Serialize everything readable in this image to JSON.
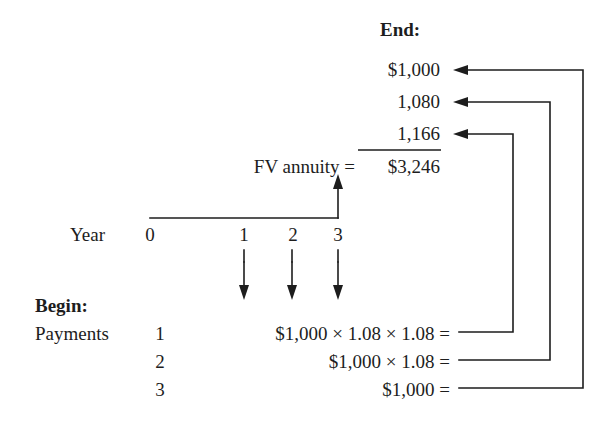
{
  "diagram": {
    "title_end": "End:",
    "title_begin": "Begin:",
    "year_label": "Year",
    "payments_label": "Payments",
    "fv_label": "FV annuity =",
    "fv_total": "$3,246",
    "end_values": [
      {
        "text": "$1,000"
      },
      {
        "text": "1,080"
      },
      {
        "text": "1,166"
      }
    ],
    "timeline_ticks": [
      "0",
      "1",
      "2",
      "3"
    ],
    "payment_rows": [
      {
        "number": "1",
        "formula": "$1,000 × 1.08 × 1.08 ="
      },
      {
        "number": "2",
        "formula": "$1,000 × 1.08 ="
      },
      {
        "number": "3",
        "formula": "$1,000 ="
      }
    ],
    "colors": {
      "ink": "#1d1d1d",
      "background": "#ffffff"
    }
  }
}
